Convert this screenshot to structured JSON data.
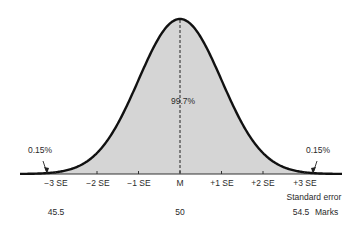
{
  "chart_data": {
    "type": "area",
    "title": "",
    "center_label": "99.7%",
    "tail_annotations": [
      {
        "side": "left",
        "label": "0.15%"
      },
      {
        "side": "right",
        "label": "0.15%"
      }
    ],
    "x_ticks": [
      "−3 SE",
      "−2 SE",
      "−1 SE",
      "M",
      "+1 SE",
      "+2 SE",
      "+3 SE"
    ],
    "x_tick_sd": [
      -3,
      -2,
      -1,
      0,
      1,
      2,
      3
    ],
    "axis_title": "Standard error",
    "marks_row": {
      "values": [
        {
          "at_sd": -3,
          "label": "45.5"
        },
        {
          "at_sd": 0,
          "label": "50"
        },
        {
          "at_sd": 3,
          "label": "54.5"
        }
      ],
      "title": "Marks"
    },
    "fill_color": "#d3d3d3",
    "curve_color": "#111111"
  }
}
